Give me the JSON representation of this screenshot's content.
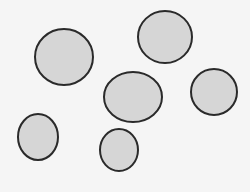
{
  "scene": {
    "background": "#f5f5f5",
    "fill": "#d6d6d6",
    "stroke": "#2a2a2a",
    "shapes": [
      {
        "name": "circle-top-left",
        "cx": 64,
        "cy": 57,
        "rx": 29,
        "ry": 28
      },
      {
        "name": "circle-top-right",
        "cx": 165,
        "cy": 37,
        "rx": 27,
        "ry": 26
      },
      {
        "name": "circle-middle",
        "cx": 133,
        "cy": 97,
        "rx": 29,
        "ry": 25
      },
      {
        "name": "circle-right",
        "cx": 214,
        "cy": 92,
        "rx": 23,
        "ry": 23
      },
      {
        "name": "circle-bottom-left",
        "cx": 38,
        "cy": 137,
        "rx": 20,
        "ry": 23
      },
      {
        "name": "circle-bottom-middle",
        "cx": 119,
        "cy": 150,
        "rx": 19,
        "ry": 21
      }
    ]
  }
}
